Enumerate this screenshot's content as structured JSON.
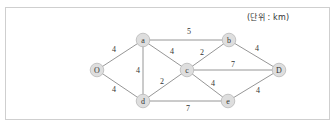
{
  "unit_label": "(단위 : km)",
  "colors": {
    "node_fill": "#dedede",
    "node_stroke": "#b9b9b9",
    "edge": "#8a8a8a",
    "text": "#333333"
  },
  "nodes": [
    {
      "id": "O",
      "label": "O",
      "x": 97,
      "y": 70
    },
    {
      "id": "a",
      "label": "a",
      "x": 143,
      "y": 40
    },
    {
      "id": "d",
      "label": "d",
      "x": 143,
      "y": 101
    },
    {
      "id": "c",
      "label": "c",
      "x": 187,
      "y": 70
    },
    {
      "id": "b",
      "label": "b",
      "x": 229,
      "y": 40
    },
    {
      "id": "D",
      "label": "D",
      "x": 279,
      "y": 70
    },
    {
      "id": "e",
      "label": "e",
      "x": 228,
      "y": 101
    }
  ],
  "edges": [
    {
      "from": "O",
      "to": "a",
      "weight": "4",
      "lx": 114,
      "ly": 52
    },
    {
      "from": "O",
      "to": "d",
      "weight": "4",
      "lx": 114,
      "ly": 92
    },
    {
      "from": "a",
      "to": "d",
      "weight": "4",
      "lx": 138,
      "ly": 73
    },
    {
      "from": "a",
      "to": "b",
      "weight": "5",
      "lx": 189,
      "ly": 34
    },
    {
      "from": "a",
      "to": "c",
      "weight": "4",
      "lx": 172,
      "ly": 54
    },
    {
      "from": "d",
      "to": "c",
      "weight": "2",
      "lx": 162,
      "ly": 84
    },
    {
      "from": "d",
      "to": "e",
      "weight": "7",
      "lx": 188,
      "ly": 111
    },
    {
      "from": "c",
      "to": "b",
      "weight": "2",
      "lx": 202,
      "ly": 55
    },
    {
      "from": "c",
      "to": "D",
      "weight": "7",
      "lx": 233,
      "ly": 67
    },
    {
      "from": "c",
      "to": "e",
      "weight": "4",
      "lx": 213,
      "ly": 86
    },
    {
      "from": "b",
      "to": "D",
      "weight": "4",
      "lx": 257,
      "ly": 51
    },
    {
      "from": "e",
      "to": "D",
      "weight": "4",
      "lx": 258,
      "ly": 93
    }
  ]
}
